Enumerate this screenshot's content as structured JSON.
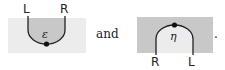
{
  "diagram_left": {
    "top_labels": [
      "L",
      "R"
    ],
    "symbol": "ε",
    "box_color": "#ececec",
    "fill_color": "#c8c8c8"
  },
  "connector_text": "and",
  "diagram_right": {
    "bottom_labels": [
      "R",
      "L"
    ],
    "symbol": "η",
    "box_color": "#c8c8c8",
    "fill_color": "#ececec"
  },
  "trailing_punct": "."
}
